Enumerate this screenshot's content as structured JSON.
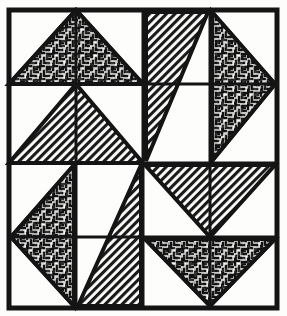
{
  "figure": {
    "kind": "scanned-line-art",
    "canvas": {
      "width": 287,
      "height": 316
    },
    "colors": {
      "paper": "#fdfdfb",
      "ink": "#171717",
      "frame": "#141414",
      "hatch_fill": "#1a1a1a",
      "maze_fill": "#111111"
    },
    "frame": {
      "x": 9,
      "y": 10,
      "width": 268,
      "height": 298,
      "stroke_width": 5
    },
    "grid": {
      "columns": 4,
      "rows": 4,
      "x_lines": [
        9,
        76,
        143,
        210,
        277
      ],
      "y_lines": [
        10,
        84,
        163,
        237,
        308
      ],
      "stroke_width": 3,
      "center_x": 143,
      "center_y": 163
    },
    "textures": [
      {
        "id": "maze",
        "label": "maze-scribble-fill",
        "description": "dense irregular meander / labyrinth stipple"
      },
      {
        "id": "hatch",
        "label": "diagonal-hatch-fill",
        "description": "45 degree parallel line hatching, lower-left to upper-right"
      }
    ],
    "quadrants": [
      {
        "name": "top-left",
        "shapes": [
          {
            "name": "maze-triangle-up-wide",
            "texture": "maze",
            "points": "9,84 143,84 76,10",
            "direction": "up"
          },
          {
            "name": "hatch-triangle-up-wide",
            "texture": "hatch",
            "points": "9,163 143,163 76,84",
            "direction": "up"
          }
        ]
      },
      {
        "name": "top-right",
        "shapes": [
          {
            "name": "hatch-triangle-down-left",
            "texture": "hatch",
            "points": "143,10 210,10 143,163",
            "direction": "left"
          },
          {
            "name": "maze-triangle-right",
            "texture": "maze",
            "points": "210,10 277,84 210,163",
            "direction": "right"
          }
        ]
      },
      {
        "name": "bottom-left",
        "shapes": [
          {
            "name": "maze-triangle-left",
            "texture": "maze",
            "points": "76,163 76,308 9,237",
            "direction": "left"
          },
          {
            "name": "hatch-triangle-up-right",
            "texture": "hatch",
            "points": "143,163 143,308 76,308",
            "direction": "right"
          }
        ]
      },
      {
        "name": "bottom-right",
        "shapes": [
          {
            "name": "hatch-triangle-down-wide",
            "texture": "hatch",
            "points": "143,163 277,163 210,237",
            "direction": "down"
          },
          {
            "name": "maze-triangle-down-wide",
            "texture": "maze",
            "points": "143,237 277,237 210,308",
            "direction": "down"
          }
        ]
      }
    ]
  }
}
